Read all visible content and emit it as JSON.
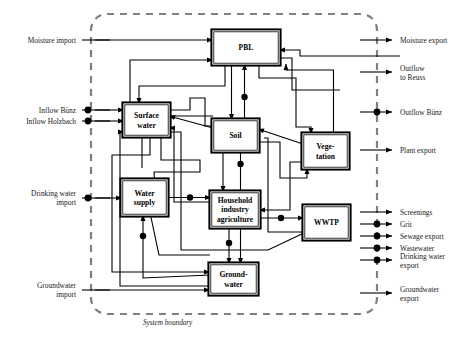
{
  "diagram": {
    "title": "System boundary",
    "boundary_label": "System boundary",
    "colors": {
      "stroke": "#000000",
      "boundary": "#808080",
      "background": "#ffffff",
      "box_fill": "#ffffff"
    },
    "nodes": [
      {
        "id": "pbl",
        "label": "PBL",
        "x": 213,
        "y": 31,
        "w": 66,
        "h": 33
      },
      {
        "id": "surface",
        "label": "Surface\nwater",
        "x": 124,
        "y": 104,
        "w": 45,
        "h": 32
      },
      {
        "id": "soil",
        "label": "Soil",
        "x": 213,
        "y": 120,
        "w": 45,
        "h": 31
      },
      {
        "id": "vegetation",
        "label": "Vege-\ntation",
        "x": 303,
        "y": 134,
        "w": 45,
        "h": 34
      },
      {
        "id": "watersupply",
        "label": "Water\nsupply",
        "x": 122,
        "y": 180,
        "w": 45,
        "h": 35
      },
      {
        "id": "household",
        "label": "Household\nindustry\nagriculture",
        "x": 211,
        "y": 192,
        "w": 48,
        "h": 35
      },
      {
        "id": "wwtp",
        "label": "WWTP",
        "x": 304,
        "y": 206,
        "w": 45,
        "h": 33
      },
      {
        "id": "groundwater",
        "label": "Ground-\nwater",
        "x": 210,
        "y": 264,
        "w": 47,
        "h": 30
      }
    ],
    "imports": [
      {
        "id": "moisture-import",
        "label": "Moisture import",
        "y": 40,
        "dot": false
      },
      {
        "id": "inflow-buenz",
        "label": "Inflow Bünz",
        "y": 110,
        "dot": true
      },
      {
        "id": "inflow-holzbach",
        "label": "Inflow Holzbach",
        "y": 121,
        "dot": true
      },
      {
        "id": "drinking-water-import",
        "label": "Drinking water\nimport",
        "y": 198,
        "dot": true
      },
      {
        "id": "groundwater-import",
        "label": "Groundwater\nimport",
        "y": 290,
        "dot": false
      }
    ],
    "exports": [
      {
        "id": "moisture-export",
        "label": "Moisture export",
        "y": 40,
        "dot": false
      },
      {
        "id": "outflow-to-reuss",
        "label": "Outflow\nto Reuss",
        "y": 72,
        "dot": false
      },
      {
        "id": "outflow-buenz",
        "label": "Outflow Bünz",
        "y": 112,
        "dot": true
      },
      {
        "id": "plant-export",
        "label": "Plant export",
        "y": 150,
        "dot": false
      },
      {
        "id": "screenings",
        "label": "Screenings",
        "y": 212,
        "dot": false
      },
      {
        "id": "grit",
        "label": "Grit",
        "y": 224,
        "dot": true
      },
      {
        "id": "sewage-export",
        "label": "Sewage export",
        "y": 236,
        "dot": true
      },
      {
        "id": "wastewater",
        "label": "Wastewater",
        "y": 248,
        "dot": true
      },
      {
        "id": "drinking-water-export",
        "label": "Drinking water\nexport",
        "y": 260,
        "dot": true
      },
      {
        "id": "groundwater-export",
        "label": "Groundwater\nexport",
        "y": 293,
        "dot": false
      }
    ],
    "boundary": {
      "x": 91,
      "y": 14,
      "w": 286,
      "h": 300
    }
  }
}
